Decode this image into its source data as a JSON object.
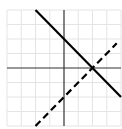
{
  "chart_data": {
    "type": "line",
    "title": "",
    "xlabel": "",
    "ylabel": "",
    "xlim": [
      -4,
      4
    ],
    "ylim": [
      -4,
      4
    ],
    "grid": true,
    "grid_step": 1,
    "legend": "none",
    "series": [
      {
        "name": "solid-line",
        "style": "solid",
        "equation": "y = -x + 2",
        "x": [
          -2,
          4
        ],
        "y": [
          4,
          -2
        ],
        "color": "#000000"
      },
      {
        "name": "dashed-line",
        "style": "dashed",
        "equation": "y = x - 2",
        "x": [
          -2,
          3.7
        ],
        "y": [
          -4,
          1.7
        ],
        "color": "#000000"
      }
    ],
    "colors": {
      "grid": "#e4e4e4",
      "axis": "#333333"
    }
  }
}
